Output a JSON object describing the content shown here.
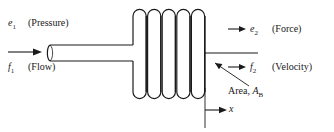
{
  "figure": {
    "stroke_color": "#1a1a1a",
    "background_color": "#ffffff"
  },
  "labels": {
    "e1": {
      "symbol": "e",
      "subscript": "1",
      "description": "(Pressure)"
    },
    "f1": {
      "symbol": "f",
      "subscript": "1",
      "description": "(Flow)"
    },
    "e2": {
      "symbol": "e",
      "subscript": "2",
      "description": "(Force)"
    },
    "f2": {
      "symbol": "f",
      "subscript": "2",
      "description": "(Velocity)"
    },
    "area": {
      "prefix": "Area, ",
      "symbol": "A",
      "subscript": "B"
    },
    "displacement": {
      "symbol": "x"
    }
  },
  "arrows": {
    "inlet_flow": "arrow-right",
    "output_force": "arrow-right",
    "output_velocity": "arrow-right",
    "displacement": "arrow-right",
    "area_leader": "leader-line-arrow"
  },
  "parts": {
    "bellows": {
      "name": "bellows",
      "convolutions": 5
    },
    "inlet_tube": {
      "name": "inlet-tube"
    },
    "output_rod": {
      "name": "output-rod"
    },
    "datum_line": {
      "name": "datum-line"
    }
  }
}
